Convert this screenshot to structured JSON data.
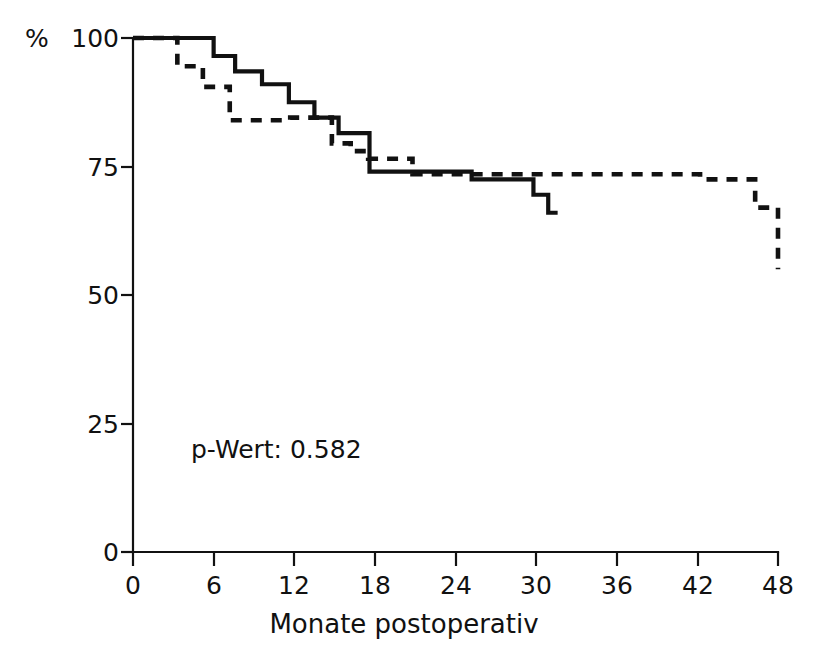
{
  "chart_data": {
    "type": "line",
    "title": "",
    "subtitle": "",
    "xlabel": "Monate postoperativ",
    "ylabel": "%",
    "ylabel_unit": "%",
    "xlim": [
      0,
      48
    ],
    "ylim": [
      0,
      100
    ],
    "xticks": [
      0,
      6,
      12,
      18,
      24,
      30,
      36,
      42,
      48
    ],
    "xtick_labels": [
      "0",
      "6",
      "12",
      "18",
      "24",
      "30",
      "36",
      "42",
      "48"
    ],
    "yticks": [
      0,
      25,
      50,
      75,
      100
    ],
    "ytick_labels": [
      "0",
      "25",
      "50",
      "75",
      "100"
    ],
    "grid": false,
    "legend": "none",
    "step_type": "post",
    "annotations": [
      {
        "text": "p-Wert: 0.582",
        "x": 6.5,
        "y": 23.5
      }
    ],
    "series": [
      {
        "name": "solid-curve",
        "style": "solid",
        "color": "#111111",
        "x": [
          0,
          6,
          6,
          7.6,
          9.6,
          11.6,
          13.5,
          15.3,
          16.2,
          17.6,
          17.6,
          25.2,
          29.8,
          30.9,
          31.0
        ],
        "y": [
          100,
          100,
          96.5,
          96.5,
          93.5,
          91.0,
          87.5,
          84.5,
          84.5,
          81.5,
          74.0,
          74.0,
          72.5,
          72.5,
          66.0
        ],
        "points": [
          {
            "x": 0.0,
            "y": 100.0
          },
          {
            "x": 6.0,
            "y": 100.0
          },
          {
            "x": 6.0,
            "y": 96.5
          },
          {
            "x": 7.6,
            "y": 96.5
          },
          {
            "x": 7.6,
            "y": 93.5
          },
          {
            "x": 9.6,
            "y": 93.5
          },
          {
            "x": 9.6,
            "y": 91.0
          },
          {
            "x": 11.6,
            "y": 91.0
          },
          {
            "x": 11.6,
            "y": 87.5
          },
          {
            "x": 13.5,
            "y": 87.5
          },
          {
            "x": 13.5,
            "y": 84.5
          },
          {
            "x": 15.3,
            "y": 84.5
          },
          {
            "x": 15.3,
            "y": 81.5
          },
          {
            "x": 17.6,
            "y": 81.5
          },
          {
            "x": 17.6,
            "y": 74.0
          },
          {
            "x": 25.2,
            "y": 74.0
          },
          {
            "x": 25.2,
            "y": 72.5
          },
          {
            "x": 29.8,
            "y": 72.5
          },
          {
            "x": 29.8,
            "y": 69.5
          },
          {
            "x": 30.9,
            "y": 69.5
          },
          {
            "x": 30.9,
            "y": 66.0
          },
          {
            "x": 31.6,
            "y": 66.0
          }
        ]
      },
      {
        "name": "dashed-curve",
        "style": "dashed",
        "color": "#111111",
        "x": [
          0,
          3.3,
          3.3,
          5.2,
          5.2,
          7.2,
          7.2,
          11.7,
          11.7,
          14.8,
          14.8,
          16.2,
          16.2,
          17.5,
          17.5,
          20.8,
          20.8,
          42.2,
          42.2,
          46.3,
          46.3,
          48.0,
          48.0
        ],
        "y": [
          100,
          100,
          94.5,
          94.5,
          90.5,
          90.5,
          84.0,
          84.0,
          84.5,
          84.5,
          79.5,
          79.5,
          78.0,
          78.0,
          76.5,
          76.5,
          73.5,
          73.5,
          72.5,
          72.5,
          67.0,
          67.0,
          55.0
        ],
        "points": [
          {
            "x": 0.0,
            "y": 100.0
          },
          {
            "x": 3.3,
            "y": 100.0
          },
          {
            "x": 3.3,
            "y": 94.5
          },
          {
            "x": 5.2,
            "y": 94.5
          },
          {
            "x": 5.2,
            "y": 90.5
          },
          {
            "x": 7.2,
            "y": 90.5
          },
          {
            "x": 7.2,
            "y": 84.0
          },
          {
            "x": 11.7,
            "y": 84.0
          },
          {
            "x": 11.7,
            "y": 84.5
          },
          {
            "x": 14.8,
            "y": 84.5
          },
          {
            "x": 14.8,
            "y": 79.5
          },
          {
            "x": 16.2,
            "y": 79.5
          },
          {
            "x": 16.2,
            "y": 78.0
          },
          {
            "x": 17.5,
            "y": 78.0
          },
          {
            "x": 17.5,
            "y": 76.5
          },
          {
            "x": 20.8,
            "y": 76.5
          },
          {
            "x": 20.8,
            "y": 73.5
          },
          {
            "x": 42.2,
            "y": 73.5
          },
          {
            "x": 42.2,
            "y": 72.5
          },
          {
            "x": 46.3,
            "y": 72.5
          },
          {
            "x": 46.3,
            "y": 67.0
          },
          {
            "x": 48.0,
            "y": 67.0
          },
          {
            "x": 48.0,
            "y": 55.0
          }
        ]
      }
    ]
  },
  "axes": {
    "y_unit_symbol": "%",
    "x_axis_title": "Monate postoperativ",
    "y_tick_100": "100",
    "y_tick_75": "75",
    "y_tick_50": "50",
    "y_tick_25": "25",
    "y_tick_0": "0",
    "x_tick_0": "0",
    "x_tick_6": "6",
    "x_tick_12": "12",
    "x_tick_18": "18",
    "x_tick_24": "24",
    "x_tick_30": "30",
    "x_tick_36": "36",
    "x_tick_42": "42",
    "x_tick_48": "48"
  },
  "annotation": {
    "p_value_text": "p-Wert: 0.582"
  },
  "colors": {
    "ink": "#111111",
    "background": "#ffffff"
  }
}
